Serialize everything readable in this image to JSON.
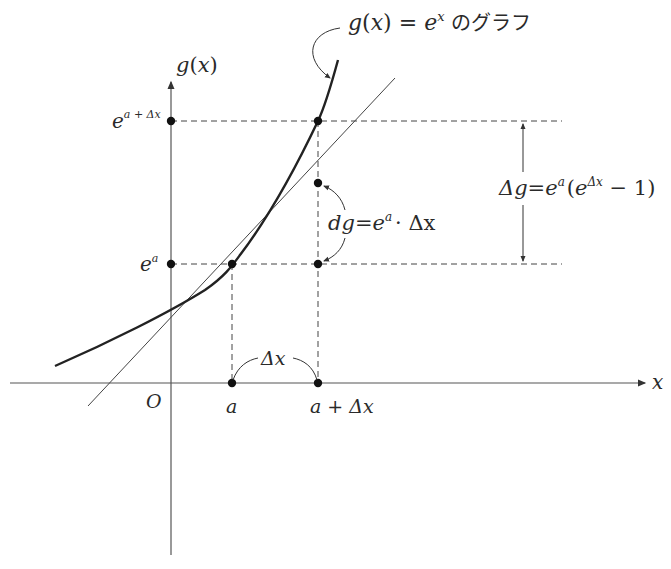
{
  "diagram": {
    "curve_label": {
      "func": "g",
      "arg": "x",
      "equals": "=",
      "base": "e",
      "exp": "x",
      "suffix": "のグラフ"
    },
    "axes": {
      "y_label_func": "g",
      "y_label_arg": "x",
      "x_label": "x",
      "origin": "O"
    },
    "y_ticks": {
      "upper": {
        "base": "e",
        "exp": "a + Δx"
      },
      "lower": {
        "base": "e",
        "exp": "a"
      }
    },
    "x_ticks": {
      "left": "a",
      "right": "a + Δx"
    },
    "delta_x_label": "Δx",
    "dg_label": {
      "lhs": "dg",
      "eq": "=",
      "base": "e",
      "exp": "a",
      "rest": "· Δx"
    },
    "delta_g_label": {
      "lhs": "Δg",
      "eq": "=",
      "base": "e",
      "exp": "a",
      "paren_open": "(",
      "inner_base": "e",
      "inner_exp": "Δx",
      "minus_one": " − 1)"
    },
    "colors": {
      "ink": "#2a2a2a",
      "axis": "#555555",
      "background": "#ffffff"
    }
  }
}
